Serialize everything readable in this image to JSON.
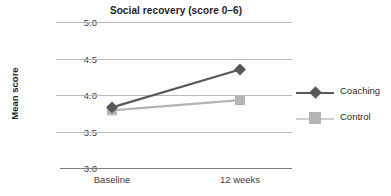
{
  "chart_data": {
    "type": "line",
    "title": "Social recovery (score 0–6)",
    "xlabel": "",
    "ylabel": "Mean score",
    "categories": [
      "Baseline",
      "12 weeks"
    ],
    "series": [
      {
        "name": "Coaching",
        "values": [
          3.83,
          4.35
        ],
        "color": "#595959",
        "marker": "diamond"
      },
      {
        "name": "Control",
        "values": [
          3.79,
          3.93
        ],
        "color": "#b5b5b5",
        "marker": "square"
      }
    ],
    "ylim": [
      3.0,
      5.0
    ],
    "yticks": [
      "3.0",
      "3.5",
      "4.0",
      "4.5",
      "5.0"
    ],
    "ytick_values": [
      3.0,
      3.5,
      4.0,
      4.5,
      5.0
    ],
    "grid": true,
    "legend_position": "right"
  },
  "legend": {
    "entries": [
      {
        "label": "Coaching"
      },
      {
        "label": "Control"
      }
    ]
  }
}
